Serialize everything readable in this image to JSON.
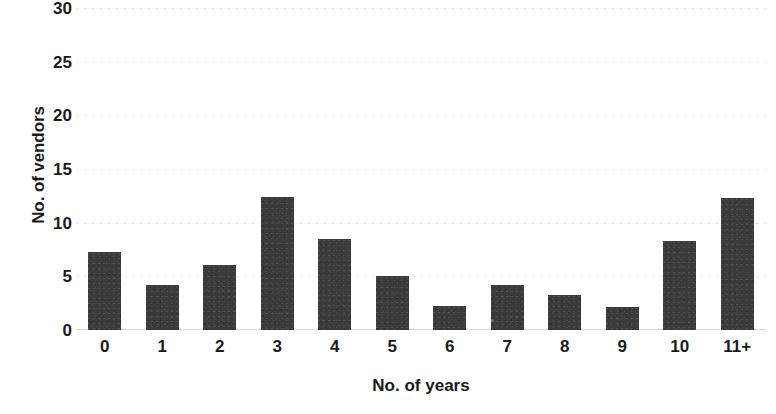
{
  "chart_data": {
    "type": "bar",
    "title": "",
    "xlabel": "No. of years",
    "ylabel": "No. of vendors",
    "categories": [
      "0",
      "1",
      "2",
      "3",
      "4",
      "5",
      "6",
      "7",
      "8",
      "9",
      "10",
      "11+"
    ],
    "values": [
      7.3,
      4.2,
      6.1,
      12.4,
      8.5,
      5.0,
      2.2,
      4.2,
      3.3,
      2.1,
      8.3,
      12.3
    ],
    "series": [
      {
        "name": "No. of vendors",
        "values": [
          7.3,
          4.2,
          6.1,
          12.4,
          8.5,
          5.0,
          2.2,
          4.2,
          3.3,
          2.1,
          8.3,
          12.3
        ]
      }
    ],
    "ylim": [
      0,
      30
    ],
    "y_ticks": [
      0,
      5,
      10,
      15,
      20,
      25,
      30
    ],
    "y_tick_labels": [
      "0",
      "5",
      "10",
      "15",
      "20",
      "25",
      "30"
    ],
    "x_tick_labels": [
      "0",
      "1",
      "2",
      "3",
      "4",
      "5",
      "6",
      "7",
      "8",
      "9",
      "10",
      "11+"
    ],
    "grid": true,
    "grid_axis": "y",
    "legend": false,
    "legend_position": "none",
    "bar_color": "#3b3b3b",
    "background_color": "#ffffff",
    "text_color": "#1a1a1a",
    "gridline_color": "#e8e8e8",
    "annotations": []
  }
}
